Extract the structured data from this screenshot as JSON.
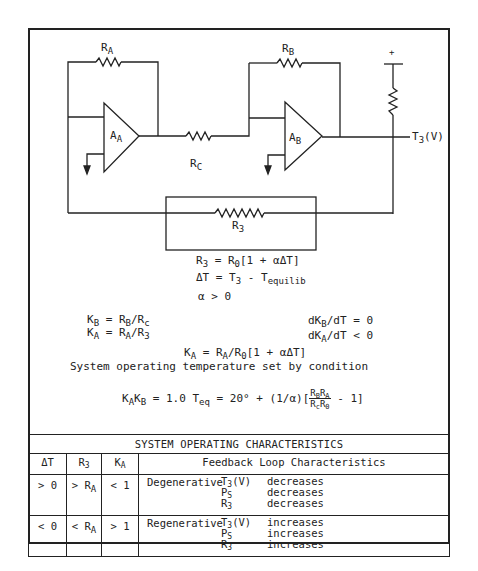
{
  "circuit": {
    "labels": {
      "ra": {
        "main": "R",
        "sub": "A"
      },
      "rb": {
        "main": "R",
        "sub": "B"
      },
      "rc": {
        "main": "R",
        "sub": "C"
      },
      "r3": {
        "main": "R",
        "sub": "3"
      },
      "aa": {
        "main": "A",
        "sub": "A"
      },
      "ab": {
        "main": "A",
        "sub": "B"
      },
      "plus": "+",
      "t3_output": {
        "main": "T",
        "sub": "3",
        "tail": "(V)"
      }
    }
  },
  "equations": {
    "r3_def": {
      "a": "R",
      "a_sub": "3",
      "b": " = R",
      "b_sub": "0",
      "c": "[1 + αΔT]"
    },
    "delta_t": {
      "a": "ΔT = T",
      "a_sub": "3",
      "b": " - T",
      "b_sub": "equilib"
    },
    "alpha": "α > 0",
    "kb": {
      "a": "K",
      "a_sub": "B",
      "b": " = R",
      "b_sub": "B",
      "c": "/R",
      "c_sub": "c"
    },
    "ka": {
      "a": "K",
      "a_sub": "A",
      "b": " = R",
      "b_sub": "A",
      "c": "/R",
      "c_sub": "3"
    },
    "dkb": {
      "a": "dK",
      "a_sub": "B",
      "b": "/dT = 0"
    },
    "dka": {
      "a": "dK",
      "a_sub": "A",
      "b": "/dT < 0"
    },
    "ka_full": {
      "a": "K",
      "a_sub": "A",
      "b": " = R",
      "b_sub": "A",
      "c": "/R",
      "c_sub": "0",
      "d": "[1 + αΔT]"
    },
    "condition_text": "System operating temperature set by condition",
    "teq": {
      "a": "K",
      "a_sub": "A",
      "b": "K",
      "b_sub": "B",
      "c": " = 1.0  T",
      "c_sub": "eq",
      "d": " = 20° + (1/α)[",
      "num": {
        "a": "R",
        "a_sub": "B",
        "b": "R",
        "b_sub": "A"
      },
      "den": {
        "a": "R",
        "a_sub": "c",
        "b": "R",
        "b_sub": "0"
      },
      "e": " - 1]"
    }
  },
  "table": {
    "title": "SYSTEM OPERATING CHARACTERISTICS",
    "columns": [
      {
        "main": "ΔT",
        "sub": ""
      },
      {
        "main": "R",
        "sub": "3"
      },
      {
        "main": "K",
        "sub": "A"
      },
      {
        "main": "Feedback Loop Characteristics",
        "sub": ""
      }
    ],
    "rows": [
      {
        "delta_t": "> 0",
        "r3": {
          "main": "> R",
          "sub": "A"
        },
        "ka": "< 1",
        "mode": "Degenerative",
        "effects": [
          {
            "var": "T",
            "var_sub": "3",
            "var_tail": "(V)",
            "change": "decreases"
          },
          {
            "var": "P",
            "var_sub": "S",
            "var_tail": "",
            "change": "decreases"
          },
          {
            "var": "R",
            "var_sub": "3",
            "var_tail": "",
            "change": "decreases"
          }
        ]
      },
      {
        "delta_t": "< 0",
        "r3": {
          "main": "< R",
          "sub": "A"
        },
        "ka": "> 1",
        "mode": "Regenerative",
        "effects": [
          {
            "var": "T",
            "var_sub": "3",
            "var_tail": "(V)",
            "change": "increases"
          },
          {
            "var": "P",
            "var_sub": "S",
            "var_tail": "",
            "change": "increases"
          },
          {
            "var": "R",
            "var_sub": "3",
            "var_tail": "",
            "change": "increases"
          }
        ]
      }
    ]
  }
}
